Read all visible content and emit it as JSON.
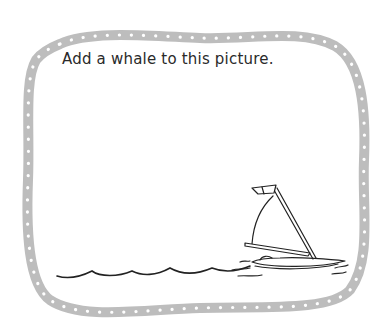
{
  "worksheet": {
    "prompt": "Add a whale to this picture.",
    "colors": {
      "border": "#bdbdbd",
      "border_dots": "#ffffff",
      "ink": "#222222",
      "background": "#ffffff"
    },
    "illustration": {
      "elements": [
        "dotted-wavy-frame",
        "water-wave-line",
        "sailboat"
      ]
    }
  }
}
